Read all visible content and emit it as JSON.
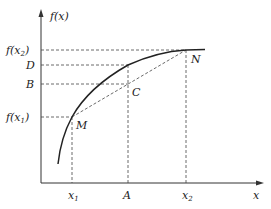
{
  "diagram": {
    "y_axis_label": "f(x)",
    "x_axis_label": "x",
    "y_ticks": [
      {
        "name": "f-x2",
        "text": "f(x",
        "sub": "2",
        "close": ")"
      },
      {
        "name": "D",
        "text": "D"
      },
      {
        "name": "B",
        "text": "B"
      },
      {
        "name": "f-x1",
        "text": "f(x",
        "sub": "1",
        "close": ")"
      }
    ],
    "x_ticks": [
      {
        "name": "x1",
        "text": "x",
        "sub": "1"
      },
      {
        "name": "A",
        "text": "A"
      },
      {
        "name": "x2",
        "text": "x",
        "sub": "2"
      }
    ],
    "points": {
      "M": "M",
      "N": "N",
      "C": "C"
    },
    "colors": {
      "stroke": "#222222",
      "dashed": "#333333"
    }
  }
}
